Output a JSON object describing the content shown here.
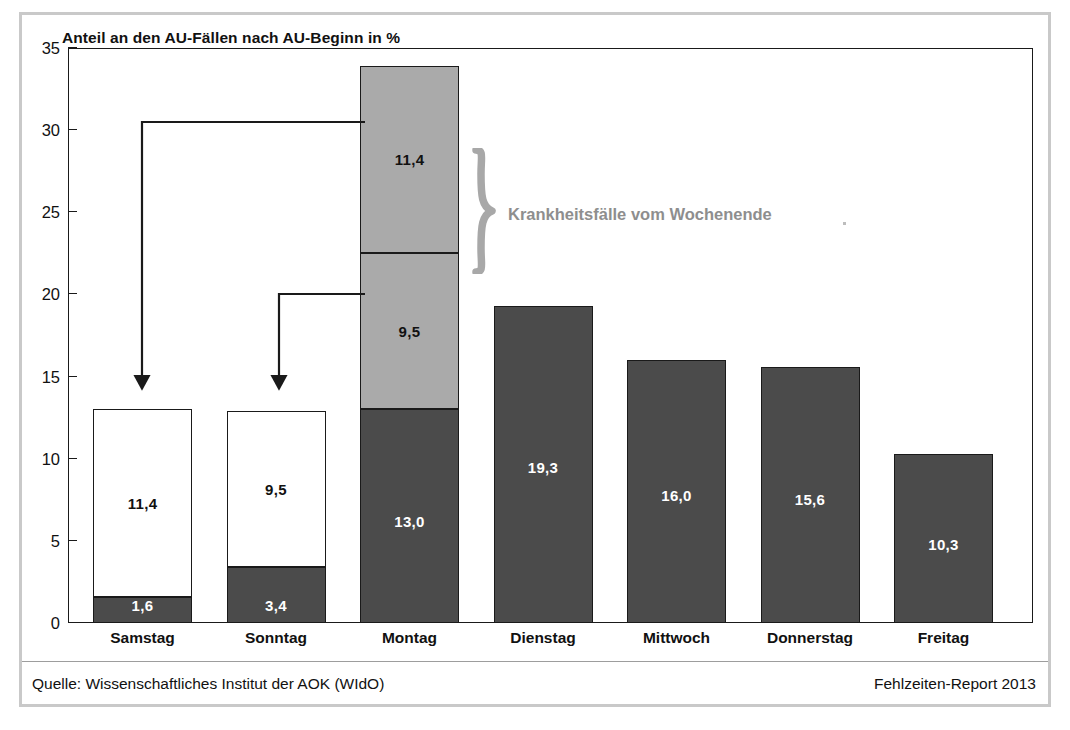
{
  "chart_data": {
    "type": "bar",
    "subtype": "stacked-bar",
    "title": "Anteil an den AU-Fällen nach AU-Beginn in %",
    "xlabel": "",
    "ylabel": "",
    "ylim": [
      0,
      35
    ],
    "ytick_step": 5,
    "yticks": [
      "0",
      "5",
      "10",
      "15",
      "20",
      "25",
      "30",
      "35"
    ],
    "grid": false,
    "legend": "none",
    "categories": [
      "Samstag",
      "Sonntag",
      "Montag",
      "Dienstag",
      "Mittwoch",
      "Donnerstag",
      "Freitag"
    ],
    "series": [
      {
        "name": "AU-Beginn am Tag",
        "style": "dark",
        "values": [
          1.6,
          3.4,
          13.0,
          19.3,
          16.0,
          15.6,
          10.3
        ],
        "labels": [
          "1,6",
          "3,4",
          "13,0",
          "19,3",
          "16,0",
          "15,6",
          "10,3"
        ]
      },
      {
        "name": "Verlagerung Sonntag",
        "style": "light",
        "values": [
          9.5,
          null,
          9.5,
          null,
          null,
          null,
          null
        ],
        "labels": [
          "9,5",
          null,
          "9,5",
          null,
          null,
          null,
          null
        ]
      },
      {
        "name": "Verlagerung Samstag",
        "style": "light",
        "values": [
          11.4,
          null,
          11.4,
          null,
          null,
          null,
          null
        ],
        "labels": [
          "11,4",
          null,
          "11,4",
          null,
          null,
          null,
          null
        ]
      }
    ],
    "bars": [
      {
        "category": "Samstag",
        "total": 13.0,
        "segments": [
          {
            "label": "1,6",
            "value": 1.6,
            "fill": "dark",
            "text_color": "light"
          },
          {
            "label": "11,4",
            "value": 11.4,
            "fill": "white",
            "text_color": "dark"
          }
        ]
      },
      {
        "category": "Sonntag",
        "total": 12.9,
        "segments": [
          {
            "label": "3,4",
            "value": 3.4,
            "fill": "dark",
            "text_color": "light"
          },
          {
            "label": "9,5",
            "value": 9.5,
            "fill": "white",
            "text_color": "dark"
          }
        ]
      },
      {
        "category": "Montag",
        "total": 33.9,
        "segments": [
          {
            "label": "13,0",
            "value": 13.0,
            "fill": "dark",
            "text_color": "light"
          },
          {
            "label": "9,5",
            "value": 9.5,
            "fill": "light",
            "text_color": "dark"
          },
          {
            "label": "11,4",
            "value": 11.4,
            "fill": "light",
            "text_color": "dark"
          }
        ]
      },
      {
        "category": "Dienstag",
        "total": 19.3,
        "segments": [
          {
            "label": "19,3",
            "value": 19.3,
            "fill": "dark",
            "text_color": "light"
          }
        ]
      },
      {
        "category": "Mittwoch",
        "total": 16.0,
        "segments": [
          {
            "label": "16,0",
            "value": 16.0,
            "fill": "dark",
            "text_color": "light"
          }
        ]
      },
      {
        "category": "Donnerstag",
        "total": 15.6,
        "segments": [
          {
            "label": "15,6",
            "value": 15.6,
            "fill": "dark",
            "text_color": "light"
          }
        ]
      },
      {
        "category": "Freitag",
        "total": 10.3,
        "segments": [
          {
            "label": "10,3",
            "value": 10.3,
            "fill": "dark",
            "text_color": "light"
          }
        ]
      }
    ],
    "annotations": [
      {
        "id": "brace-label",
        "text": "Krankheitsfälle vom Wochenende",
        "kind": "brace",
        "target": "Montag stacked light segments (9,5 + 11,4)"
      },
      {
        "id": "arrow-samstag",
        "kind": "arrow",
        "from": "Montag top segment (11,4)",
        "to": "Samstag bar"
      },
      {
        "id": "arrow-sonntag",
        "kind": "arrow",
        "from": "Montag middle segment (9,5)",
        "to": "Sonntag bar"
      }
    ]
  },
  "footer": {
    "source": "Quelle: Wissenschaftliches Institut der AOK (WIdO)",
    "report": "Fehlzeiten-Report 2013"
  },
  "colors": {
    "dark_bar": "#4b4b4b",
    "light_bar": "#aaaaaa",
    "white_bar": "#ffffff",
    "axis": "#1a1a1a",
    "annotation_gray": "#8e8e8e",
    "frame_gray": "#c9c9c9"
  }
}
